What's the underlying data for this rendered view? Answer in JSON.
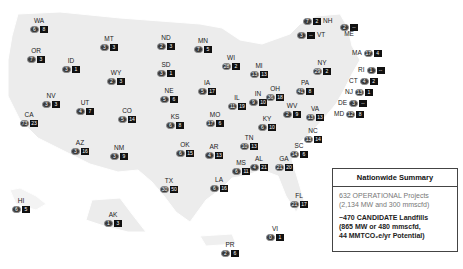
{
  "summary": {
    "title": "Nationwide Summary",
    "operational_line1": "632 OPERATIONAL Projects",
    "operational_line2": "(2,134 MW and 300 mmscfd)",
    "candidate_line1": "~470 CANDIDATE Landfills",
    "candidate_line2": "(865 MW or 480 mmscfd,",
    "candidate_line3": "44 MMTCO₂e/yr Potential)"
  },
  "legend_icons": {
    "operational": "circle-badge",
    "candidate": "square-badge"
  },
  "colors": {
    "land": "#ececec",
    "badge_dark": "#111111",
    "circle_badge": "#3a3a3a"
  },
  "states": [
    {
      "abbr": "WA",
      "operational": "6",
      "candidate": "8",
      "x": 30,
      "y": 18
    },
    {
      "abbr": "OR",
      "operational": "7",
      "candidate": "3",
      "x": 27,
      "y": 48
    },
    {
      "abbr": "ID",
      "operational": "3",
      "candidate": "1",
      "x": 62,
      "y": 58
    },
    {
      "abbr": "MT",
      "operational": "3",
      "candidate": "3",
      "x": 100,
      "y": 36
    },
    {
      "abbr": "WY",
      "operational": "2",
      "candidate": "3",
      "x": 107,
      "y": 70
    },
    {
      "abbr": "NV",
      "operational": "3",
      "candidate": "3",
      "x": 42,
      "y": 93
    },
    {
      "abbr": "UT",
      "operational": "4",
      "candidate": "7",
      "x": 76,
      "y": 100
    },
    {
      "abbr": "CA",
      "operational": "73",
      "candidate": "23",
      "x": 20,
      "y": 112
    },
    {
      "abbr": "CO",
      "operational": "5",
      "candidate": "14",
      "x": 118,
      "y": 108
    },
    {
      "abbr": "AZ",
      "operational": "3",
      "candidate": "16",
      "x": 71,
      "y": 140
    },
    {
      "abbr": "NM",
      "operational": "3",
      "candidate": "9",
      "x": 110,
      "y": 145
    },
    {
      "abbr": "ND",
      "operational": "2",
      "candidate": "3",
      "x": 157,
      "y": 35
    },
    {
      "abbr": "SD",
      "operational": "3",
      "candidate": "1",
      "x": 157,
      "y": 62
    },
    {
      "abbr": "NE",
      "operational": "5",
      "candidate": "6",
      "x": 160,
      "y": 88
    },
    {
      "abbr": "KS",
      "operational": "6",
      "candidate": "8",
      "x": 166,
      "y": 114
    },
    {
      "abbr": "OK",
      "operational": "6",
      "candidate": "15",
      "x": 176,
      "y": 142
    },
    {
      "abbr": "TX",
      "operational": "30",
      "candidate": "50",
      "x": 160,
      "y": 178
    },
    {
      "abbr": "MN",
      "operational": "7",
      "candidate": "5",
      "x": 194,
      "y": 38
    },
    {
      "abbr": "IA",
      "operational": "5",
      "candidate": "17",
      "x": 198,
      "y": 80
    },
    {
      "abbr": "MO",
      "operational": "17",
      "candidate": "6",
      "x": 206,
      "y": 112
    },
    {
      "abbr": "AR",
      "operational": "4",
      "candidate": "13",
      "x": 205,
      "y": 144
    },
    {
      "abbr": "LA",
      "operational": "6",
      "candidate": "16",
      "x": 210,
      "y": 177
    },
    {
      "abbr": "WI",
      "operational": "28",
      "candidate": "2",
      "x": 222,
      "y": 55
    },
    {
      "abbr": "IL",
      "operational": "11",
      "candidate": "19",
      "x": 228,
      "y": 95
    },
    {
      "abbr": "MI",
      "operational": "13",
      "candidate": "13",
      "x": 250,
      "y": 63
    },
    {
      "abbr": "IN",
      "operational": "9",
      "candidate": "10",
      "x": 249,
      "y": 91
    },
    {
      "abbr": "OH",
      "operational": "36",
      "candidate": "18",
      "x": 266,
      "y": 86
    },
    {
      "abbr": "KY",
      "operational": "6",
      "candidate": "10",
      "x": 258,
      "y": 116
    },
    {
      "abbr": "TN",
      "operational": "10",
      "candidate": "13",
      "x": 240,
      "y": 135
    },
    {
      "abbr": "MS",
      "operational": "6",
      "candidate": "11",
      "x": 232,
      "y": 160
    },
    {
      "abbr": "AL",
      "operational": "4",
      "candidate": "21",
      "x": 250,
      "y": 156
    },
    {
      "abbr": "GA",
      "operational": "21",
      "candidate": "20",
      "x": 275,
      "y": 156
    },
    {
      "abbr": "FL",
      "operational": "21",
      "candidate": "17",
      "x": 290,
      "y": 193
    },
    {
      "abbr": "SC",
      "operational": "14",
      "candidate": "6",
      "x": 290,
      "y": 143
    },
    {
      "abbr": "NC",
      "operational": "13",
      "candidate": "14",
      "x": 304,
      "y": 128
    },
    {
      "abbr": "VA",
      "operational": "13",
      "candidate": "13",
      "x": 306,
      "y": 106
    },
    {
      "abbr": "WV",
      "operational": "2",
      "candidate": "9",
      "x": 283,
      "y": 103
    },
    {
      "abbr": "PA",
      "operational": "41",
      "candidate": "8",
      "x": 296,
      "y": 80
    },
    {
      "abbr": "NY",
      "operational": "29",
      "candidate": "2",
      "x": 313,
      "y": 60
    },
    {
      "abbr": "HI",
      "operational": "6",
      "candidate": "5",
      "x": 12,
      "y": 198
    },
    {
      "abbr": "AK",
      "operational": "1",
      "candidate": "3",
      "x": 104,
      "y": 212
    },
    {
      "abbr": "PR",
      "operational": "2",
      "candidate": "6",
      "x": 221,
      "y": 242
    },
    {
      "abbr": "VI",
      "operational": "0",
      "candidate": "1",
      "x": 266,
      "y": 226
    }
  ],
  "inline_states": [
    {
      "abbr": "NH",
      "operational": "7",
      "candidate": "2",
      "x": 303,
      "y": 18,
      "label_side": "right"
    },
    {
      "abbr": "VT",
      "operational": "3",
      "candidate": "--",
      "x": 297,
      "y": 32,
      "label_side": "right"
    },
    {
      "abbr": "ME",
      "operational": "2",
      "candidate": "--",
      "x": 340,
      "y": 24,
      "label_side": "below"
    },
    {
      "abbr": "MA",
      "operational": "17",
      "candidate": "4",
      "x": 352,
      "y": 50,
      "label_side": "left"
    },
    {
      "abbr": "RI",
      "operational": "1",
      "candidate": "--",
      "x": 358,
      "y": 67,
      "label_side": "left"
    },
    {
      "abbr": "CT",
      "operational": "4",
      "candidate": "2",
      "x": 349,
      "y": 78,
      "label_side": "left"
    },
    {
      "abbr": "NJ",
      "operational": "13",
      "candidate": "1",
      "x": 345,
      "y": 89,
      "label_side": "left"
    },
    {
      "abbr": "DE",
      "operational": "3",
      "candidate": "--",
      "x": 338,
      "y": 100,
      "label_side": "left"
    },
    {
      "abbr": "MD",
      "operational": "12",
      "candidate": "8",
      "x": 334,
      "y": 111,
      "label_side": "left"
    }
  ]
}
